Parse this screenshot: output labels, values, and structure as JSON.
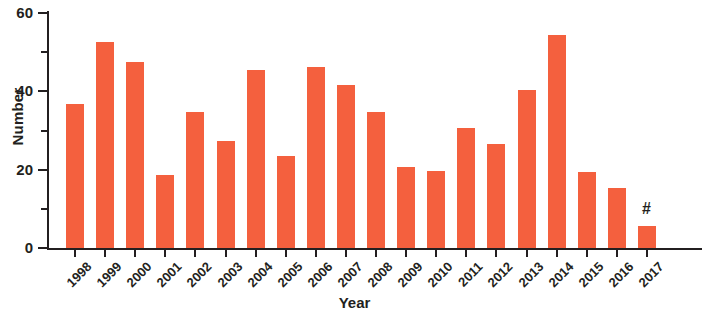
{
  "chart_data": {
    "type": "bar",
    "title": "",
    "xlabel": "Year",
    "ylabel": "Number",
    "categories": [
      "1998",
      "1999",
      "2000",
      "2001",
      "2002",
      "2003",
      "2004",
      "2005",
      "2006",
      "2007",
      "2008",
      "2009",
      "2010",
      "2011",
      "2012",
      "2013",
      "2014",
      "2015",
      "2016",
      "2017"
    ],
    "values": [
      36.7,
      52.5,
      47.4,
      18.6,
      34.8,
      27.3,
      45.4,
      23.4,
      46.3,
      41.5,
      34.8,
      20.6,
      19.6,
      30.6,
      26.5,
      40.4,
      54.3,
      19.5,
      15.3,
      5.5
    ],
    "ylim": [
      0,
      60
    ],
    "y_major_ticks": [
      0,
      20,
      40,
      60
    ],
    "y_major_tick_labels": [
      "0",
      "20",
      "40",
      "60"
    ],
    "y_minor_ticks": [
      10,
      30,
      50
    ],
    "grid": false,
    "legend": false,
    "bar_color": "#f4603e",
    "axis_color": "#231f20",
    "annotations": [
      {
        "text": "#",
        "category": "2017",
        "value": 5.5
      }
    ]
  },
  "axes": {
    "y_title": "Number",
    "x_title": "Year"
  }
}
